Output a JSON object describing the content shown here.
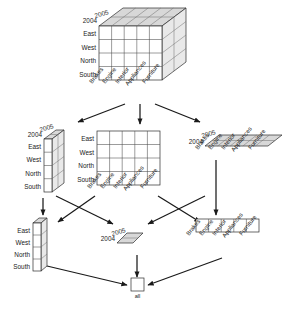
{
  "diagram": {
    "apex_label": "all",
    "dimensions": {
      "time": {
        "name": "time",
        "members": [
          "2005",
          "2004"
        ]
      },
      "region": {
        "name": "region",
        "members": [
          "East",
          "West",
          "North",
          "South"
        ]
      },
      "product": {
        "name": "product",
        "members": [
          "Brakes",
          "Engine",
          "Interior",
          "Appliances",
          "Furniture"
        ]
      }
    },
    "colors": {
      "stroke": "#2b2b2b",
      "front_face": "#ffffff",
      "top_face": "#d8d8d8",
      "side_face": "#e9e9e9",
      "gridline": "#4a4a4a",
      "arrow": "#1a1a1a"
    },
    "levels": [
      {
        "level": 0,
        "name": "base-cuboid",
        "dimensions": [
          "time",
          "region",
          "product"
        ],
        "shape": "3d-cube",
        "cells": {
          "product_cols": 5,
          "region_rows": 4,
          "time_depth": 2
        },
        "axis_labels": {
          "depth": [
            "2005",
            "2004"
          ],
          "left": [
            "East",
            "West",
            "North",
            "South"
          ],
          "bottom": [
            "Brakes",
            "Engine",
            "Interior",
            "Appliances",
            "Furniture"
          ]
        }
      },
      {
        "level": 1,
        "name": "cuboid-region-time",
        "dimensions": [
          "region",
          "time"
        ],
        "shape": "slab-vertical",
        "cells": {
          "product_cols": 1,
          "region_rows": 4,
          "time_depth": 2
        },
        "axis_labels": {
          "depth": [
            "2005",
            "2004"
          ],
          "left": [
            "East",
            "West",
            "North",
            "South"
          ],
          "bottom": []
        }
      },
      {
        "level": 1,
        "name": "cuboid-region-product",
        "dimensions": [
          "region",
          "product"
        ],
        "shape": "plane-flat",
        "cells": {
          "product_cols": 5,
          "region_rows": 4,
          "time_depth": 1
        },
        "axis_labels": {
          "depth": [],
          "left": [
            "East",
            "West",
            "North",
            "South"
          ],
          "bottom": [
            "Brakes",
            "Engine",
            "Interior",
            "Appliances",
            "Furniture"
          ]
        }
      },
      {
        "level": 1,
        "name": "cuboid-product-time",
        "dimensions": [
          "product",
          "time"
        ],
        "shape": "plane-slanted",
        "cells": {
          "product_cols": 5,
          "region_rows": 1,
          "time_depth": 2
        },
        "axis_labels": {
          "depth": [
            "2005",
            "2004"
          ],
          "left": [],
          "bottom": [
            "Brakes",
            "Engine",
            "Interior",
            "Appliances",
            "Furniture"
          ]
        }
      },
      {
        "level": 2,
        "name": "cuboid-region",
        "dimensions": [
          "region"
        ],
        "shape": "column",
        "cells": {
          "product_cols": 1,
          "region_rows": 4,
          "time_depth": 1
        },
        "axis_labels": {
          "depth": [],
          "left": [
            "East",
            "West",
            "North",
            "South"
          ],
          "bottom": []
        }
      },
      {
        "level": 2,
        "name": "cuboid-time",
        "dimensions": [
          "time"
        ],
        "shape": "parallelogram",
        "cells": {
          "product_cols": 1,
          "region_rows": 1,
          "time_depth": 2
        },
        "axis_labels": {
          "depth": [
            "2005",
            "2004"
          ],
          "left": [],
          "bottom": []
        }
      },
      {
        "level": 2,
        "name": "cuboid-product",
        "dimensions": [
          "product"
        ],
        "shape": "row",
        "cells": {
          "product_cols": 5,
          "region_rows": 1,
          "time_depth": 1
        },
        "axis_labels": {
          "depth": [],
          "left": [],
          "bottom": [
            "Brakes",
            "Engine",
            "Interior",
            "Appliances",
            "Furniture"
          ]
        }
      },
      {
        "level": 3,
        "name": "apex-cuboid",
        "dimensions": [],
        "shape": "single-cell",
        "cells": {
          "product_cols": 1,
          "region_rows": 1,
          "time_depth": 1
        },
        "axis_labels": {
          "depth": [],
          "left": [],
          "bottom": []
        },
        "caption": "all"
      }
    ],
    "edges": [
      {
        "from": "base-cuboid",
        "to": "cuboid-region-time"
      },
      {
        "from": "base-cuboid",
        "to": "cuboid-region-product"
      },
      {
        "from": "base-cuboid",
        "to": "cuboid-product-time"
      },
      {
        "from": "cuboid-region-time",
        "to": "cuboid-region"
      },
      {
        "from": "cuboid-region-time",
        "to": "cuboid-time"
      },
      {
        "from": "cuboid-region-product",
        "to": "cuboid-region"
      },
      {
        "from": "cuboid-region-product",
        "to": "cuboid-product"
      },
      {
        "from": "cuboid-product-time",
        "to": "cuboid-time"
      },
      {
        "from": "cuboid-product-time",
        "to": "cuboid-product"
      },
      {
        "from": "cuboid-region",
        "to": "apex-cuboid"
      },
      {
        "from": "cuboid-time",
        "to": "apex-cuboid"
      },
      {
        "from": "cuboid-product",
        "to": "apex-cuboid"
      }
    ]
  }
}
